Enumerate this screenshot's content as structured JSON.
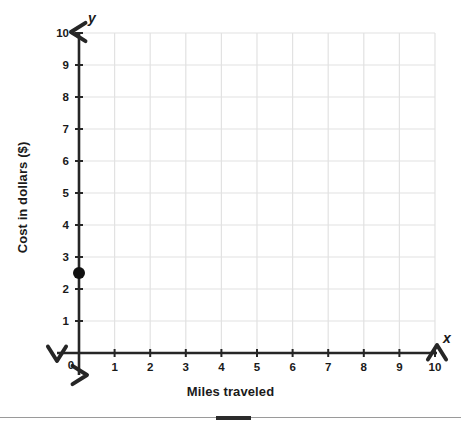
{
  "chart_data": {
    "type": "scatter",
    "title": "",
    "xlabel": "Miles traveled",
    "ylabel": "Cost in dollars ($)",
    "x_axis_letter": "x",
    "y_axis_letter": "y",
    "xlim": [
      0,
      10
    ],
    "ylim": [
      0,
      10
    ],
    "x_ticks": [
      "0",
      "1",
      "2",
      "3",
      "4",
      "5",
      "6",
      "7",
      "8",
      "9",
      "10"
    ],
    "y_ticks": [
      "0",
      "1",
      "2",
      "3",
      "4",
      "5",
      "6",
      "7",
      "8",
      "9",
      "10"
    ],
    "x_tick_values": [
      0,
      1,
      2,
      3,
      4,
      5,
      6,
      7,
      8,
      9,
      10
    ],
    "y_tick_values": [
      0,
      1,
      2,
      3,
      4,
      5,
      6,
      7,
      8,
      9,
      10
    ],
    "origin_label": "0",
    "grid": true,
    "legend": "none",
    "points": [
      {
        "x": 0,
        "y": 2.5,
        "label": "(0, 2.5)"
      }
    ],
    "series": [
      {
        "name": "plotted point",
        "x": [
          0
        ],
        "y": [
          2.5
        ]
      }
    ],
    "colors": {
      "grid": "#e2e2e2",
      "axis": "#262626",
      "point": "#111111",
      "text": "#1a1a1a",
      "background": "#ffffff"
    }
  },
  "scrollbar": {
    "track_color": "#9a9a9a",
    "thumb_color": "#2b2b2b"
  }
}
